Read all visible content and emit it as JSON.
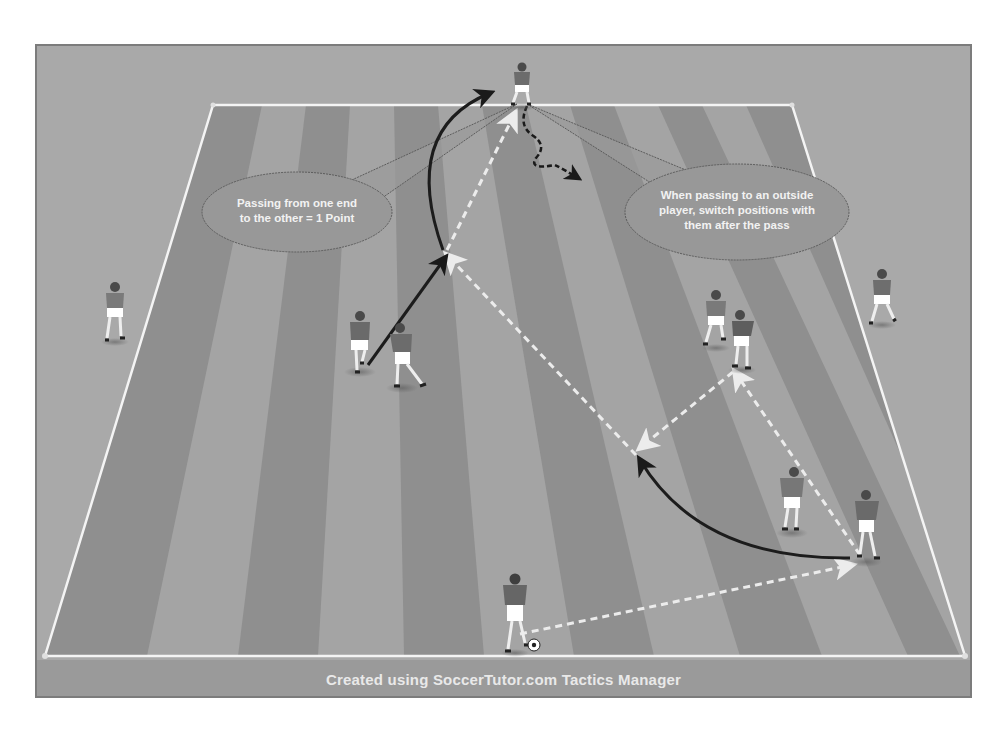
{
  "caption": "Created using SoccerTutor.com Tactics Manager",
  "callouts": [
    {
      "id": "scoring",
      "text": "Passing from one end\nto the other = 1 Point"
    },
    {
      "id": "switch",
      "text": "When passing to an outside\nplayer, switch positions with\nthem after the pass"
    }
  ],
  "colors": {
    "frame_bg": "#a9a9a9",
    "pitch_dark": "#8e8e8e",
    "pitch_light": "#a3a3a3",
    "lines": "#f4f4f4",
    "pass_arrow": "#e8e8e8",
    "run_arrow": "#1c1c1c",
    "jersey": "#6d6d6d",
    "shorts": "#ffffff"
  },
  "legend": {
    "pass": "dashed white arrow",
    "player_run": "solid black arrow",
    "dribble": "dashed black wavy arrow"
  },
  "players": [
    {
      "id": "top-end",
      "x": 522,
      "y": 90,
      "role": "end player (top)"
    },
    {
      "id": "left-outside",
      "x": 115,
      "y": 310,
      "role": "outside player (left)"
    },
    {
      "id": "right-outside",
      "x": 880,
      "y": 295,
      "role": "outside player (right)"
    },
    {
      "id": "left-pair-a",
      "x": 360,
      "y": 345,
      "role": "inside player"
    },
    {
      "id": "left-pair-b",
      "x": 405,
      "y": 355,
      "role": "inside player"
    },
    {
      "id": "right-pair-a",
      "x": 718,
      "y": 318,
      "role": "inside player"
    },
    {
      "id": "right-pair-b",
      "x": 742,
      "y": 340,
      "role": "inside player"
    },
    {
      "id": "mid-right",
      "x": 792,
      "y": 500,
      "role": "inside player"
    },
    {
      "id": "far-right",
      "x": 865,
      "y": 525,
      "role": "inside player"
    },
    {
      "id": "bottom-end",
      "x": 515,
      "y": 615,
      "role": "end player (bottom, with ball)"
    }
  ]
}
